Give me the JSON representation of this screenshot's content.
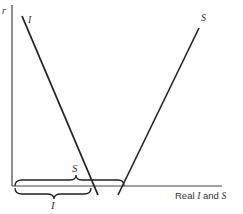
{
  "diagram": {
    "y_axis_label": "r",
    "x_axis_label_prefix": "Real ",
    "x_axis_label_i": "I",
    "x_axis_label_mid": " and ",
    "x_axis_label_s": "S",
    "curves": [
      {
        "name": "I",
        "label": "I",
        "from": [
          22,
          16
        ],
        "to": [
          98,
          195
        ]
      },
      {
        "name": "S",
        "label": "S",
        "from": [
          199,
          28
        ],
        "to": [
          118,
          195
        ]
      }
    ],
    "braces": [
      {
        "name": "S",
        "label": "S",
        "position": "above-axis"
      },
      {
        "name": "I",
        "label": "I",
        "position": "below-axis"
      }
    ],
    "line_color": "#222222"
  }
}
